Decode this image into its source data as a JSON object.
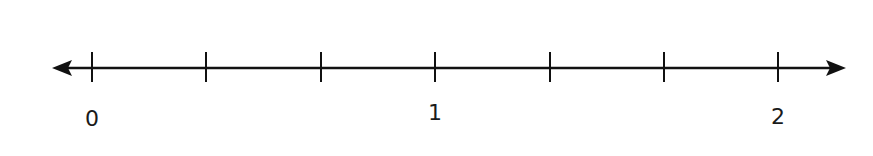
{
  "diagram": {
    "type": "number-line",
    "color": "#111111",
    "line": {
      "y": 68,
      "x_start": 52,
      "x_end": 846
    },
    "ticks": [
      {
        "x": 92,
        "label": "0"
      },
      {
        "x": 206,
        "label": ""
      },
      {
        "x": 321,
        "label": ""
      },
      {
        "x": 435,
        "label": "1"
      },
      {
        "x": 550,
        "label": ""
      },
      {
        "x": 664,
        "label": ""
      },
      {
        "x": 778,
        "label": "2"
      }
    ],
    "labels": [
      "0",
      "1",
      "2"
    ],
    "subdivisions_per_unit": 3
  }
}
